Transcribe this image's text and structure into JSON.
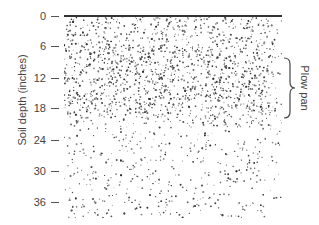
{
  "figure": {
    "y_axis_label": "Soil depth (inches)",
    "ticks": [
      {
        "label": "0",
        "y": 16
      },
      {
        "label": "6",
        "y": 46
      },
      {
        "label": "12",
        "y": 78
      },
      {
        "label": "18",
        "y": 108
      },
      {
        "label": "24",
        "y": 140
      },
      {
        "label": "30",
        "y": 171
      },
      {
        "label": "36",
        "y": 202
      }
    ],
    "annotation": "Plow pan",
    "layers": [
      {
        "name": "surface soil",
        "from_in": 0,
        "to_in": 6,
        "density": "dense"
      },
      {
        "name": "plow pan",
        "from_in": 6,
        "to_in": 19,
        "density": "very dense"
      },
      {
        "name": "subsoil",
        "from_in": 19,
        "to_in": 38,
        "density": "sparse"
      }
    ],
    "colors": {
      "stipple": "#333333",
      "background": "#ffffff",
      "surface_line": "#333333"
    }
  }
}
